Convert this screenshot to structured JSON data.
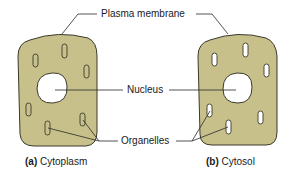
{
  "colors": {
    "cytoplasm_fill": "#c8c08a",
    "outline": "#3a3a2a",
    "nucleus_fill": "#ffffff",
    "leader_line": "#2a2a2a"
  },
  "labels": {
    "plasma_membrane": "Plasma membrane",
    "nucleus": "Nucleus",
    "organelles": "Organelles"
  },
  "captions": {
    "a": {
      "letter": "(a)",
      "text": "Cytoplasm"
    },
    "b": {
      "letter": "(b)",
      "text": "Cytosol"
    }
  },
  "cells": [
    {
      "id": "a",
      "name": "Cytoplasm",
      "organelle_style": "tan filled (part of cytoplasm)"
    },
    {
      "id": "b",
      "name": "Cytosol",
      "organelle_style": "white (excluded from cytosol)"
    }
  ]
}
